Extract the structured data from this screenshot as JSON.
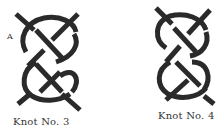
{
  "figures": [
    {
      "caption": "Knot No. 3",
      "marker": "A"
    },
    {
      "caption": "Knot No. 4"
    }
  ]
}
